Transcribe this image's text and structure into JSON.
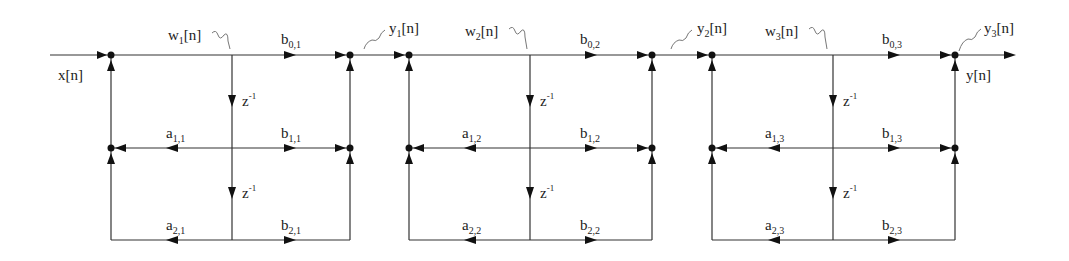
{
  "diagram": {
    "input_label": "x[n]",
    "output_label": "y[n]",
    "delay_label": "z",
    "delay_exp": "-1",
    "colors": {
      "line": "#333333",
      "node": "#111111",
      "text": "#222222",
      "background": "#ffffff"
    },
    "sections": [
      {
        "index": 1,
        "state": {
          "base": "w",
          "sub": "1",
          "suffix": "[n]"
        },
        "output": {
          "base": "y",
          "sub": "1",
          "suffix": "[n]"
        },
        "coeffs": {
          "b0": {
            "base": "b",
            "sub": "0,1"
          },
          "b1": {
            "base": "b",
            "sub": "1,1"
          },
          "b2": {
            "base": "b",
            "sub": "2,1"
          },
          "a1": {
            "base": "a",
            "sub": "1,1"
          },
          "a2": {
            "base": "a",
            "sub": "2,1"
          }
        }
      },
      {
        "index": 2,
        "state": {
          "base": "w",
          "sub": "2",
          "suffix": "[n]"
        },
        "output": {
          "base": "y",
          "sub": "2",
          "suffix": "[n]"
        },
        "coeffs": {
          "b0": {
            "base": "b",
            "sub": "0,2"
          },
          "b1": {
            "base": "b",
            "sub": "1,2"
          },
          "b2": {
            "base": "b",
            "sub": "2,2"
          },
          "a1": {
            "base": "a",
            "sub": "1,2"
          },
          "a2": {
            "base": "a",
            "sub": "2,2"
          }
        }
      },
      {
        "index": 3,
        "state": {
          "base": "w",
          "sub": "3",
          "suffix": "[n]"
        },
        "output": {
          "base": "y",
          "sub": "3",
          "suffix": "[n]"
        },
        "coeffs": {
          "b0": {
            "base": "b",
            "sub": "0,3"
          },
          "b1": {
            "base": "b",
            "sub": "1,3"
          },
          "b2": {
            "base": "b",
            "sub": "2,3"
          },
          "a1": {
            "base": "a",
            "sub": "1,3"
          },
          "a2": {
            "base": "a",
            "sub": "2,3"
          }
        }
      }
    ]
  }
}
